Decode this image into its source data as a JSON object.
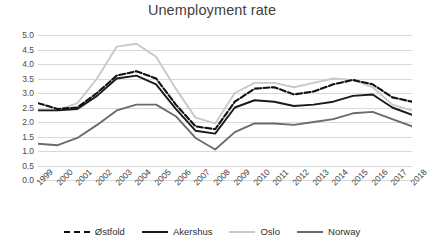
{
  "chart_data": {
    "type": "line",
    "title": "Unemployment rate",
    "xlabel": "",
    "ylabel": "",
    "ylim": [
      0.0,
      5.0
    ],
    "ytick_step": 0.5,
    "yticks": [
      "5.0",
      "4.5",
      "4.0",
      "3.5",
      "3.0",
      "2.5",
      "2.0",
      "1.5",
      "1.0",
      "0.5",
      "0.0"
    ],
    "grid": true,
    "legend_position": "bottom",
    "categories": [
      "1999",
      "2000",
      "2001",
      "2002",
      "2003",
      "2004",
      "2005",
      "2006",
      "2007",
      "2008",
      "2009",
      "2010",
      "2011",
      "2012",
      "2013",
      "2014",
      "2015",
      "2016",
      "2017",
      "2018"
    ],
    "series": [
      {
        "name": "Østfold",
        "color": "#111111",
        "style": "dash-dot",
        "values": [
          2.65,
          2.45,
          2.5,
          3.0,
          3.6,
          3.75,
          3.5,
          2.6,
          1.85,
          1.75,
          2.7,
          3.15,
          3.2,
          2.95,
          3.05,
          3.3,
          3.45,
          3.3,
          2.85,
          2.7
        ]
      },
      {
        "name": "Akershus",
        "color": "#1a1a1a",
        "style": "solid",
        "values": [
          2.4,
          2.4,
          2.45,
          2.9,
          3.5,
          3.6,
          3.3,
          2.45,
          1.7,
          1.6,
          2.5,
          2.75,
          2.7,
          2.55,
          2.6,
          2.7,
          2.9,
          2.95,
          2.5,
          2.25
        ]
      },
      {
        "name": "Oslo",
        "color": "#c9c9c9",
        "style": "solid",
        "values": [
          2.4,
          2.4,
          2.65,
          3.5,
          4.6,
          4.7,
          4.25,
          3.15,
          2.15,
          1.95,
          3.0,
          3.35,
          3.35,
          3.2,
          3.35,
          3.5,
          3.45,
          3.2,
          2.6,
          2.4
        ]
      },
      {
        "name": "Norway",
        "color": "#6b6b6b",
        "style": "solid",
        "values": [
          1.25,
          1.2,
          1.45,
          1.9,
          2.4,
          2.6,
          2.6,
          2.2,
          1.45,
          1.05,
          1.65,
          1.95,
          1.95,
          1.9,
          2.0,
          2.1,
          2.3,
          2.35,
          2.1,
          1.85
        ]
      }
    ]
  }
}
